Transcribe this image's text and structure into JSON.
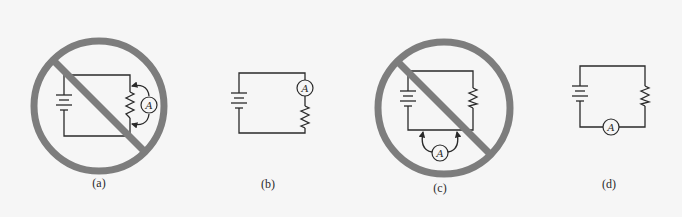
{
  "figure": {
    "background": "#f6f6f6",
    "prohibit_color": "#7d7d7d",
    "wire_color": "#2a2a2a",
    "panels": [
      {
        "id": "a",
        "label": "(a)",
        "ammeter_symbol": "A",
        "prohibited": true,
        "ammeter_placement": "parallel across resistor"
      },
      {
        "id": "b",
        "label": "(b)",
        "ammeter_symbol": "A",
        "prohibited": false,
        "ammeter_placement": "series, above resistor"
      },
      {
        "id": "c",
        "label": "(c)",
        "ammeter_symbol": "A",
        "prohibited": true,
        "ammeter_placement": "parallel across bottom wire"
      },
      {
        "id": "d",
        "label": "(d)",
        "ammeter_symbol": "A",
        "prohibited": false,
        "ammeter_placement": "series, bottom wire"
      }
    ]
  }
}
